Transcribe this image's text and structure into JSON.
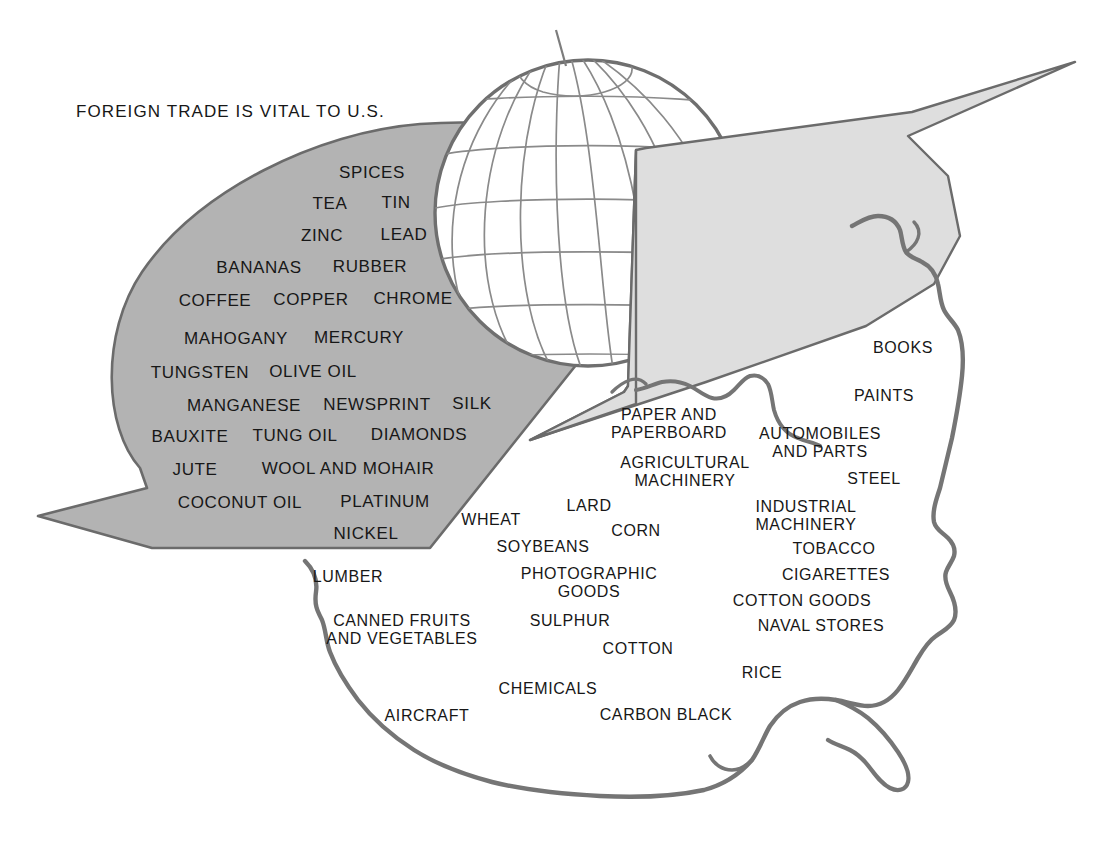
{
  "title": {
    "text": "FOREIGN TRADE IS VITAL TO U.S.",
    "x": 76,
    "y": 112
  },
  "colors": {
    "import_arrow_fill": "#b3b3b3",
    "export_arrow_fill": "#dedede",
    "outline_stroke": "#6b6b6b",
    "globe_stroke": "#6f6f6f",
    "text": "#171717",
    "background": "#ffffff"
  },
  "shapes": {
    "globe": {
      "name": "globe",
      "cx": 588,
      "cy": 213,
      "r": 153,
      "meridians": 6,
      "parallels": 7,
      "axis_tilt_deg": -6
    },
    "import_arrow": {
      "name": "imports-arrow",
      "label": "Imports arrow pointing down-left into the U.S.",
      "fill": "#b3b3b3",
      "direction": "down-left",
      "tip": [
        38,
        516
      ]
    },
    "export_arrow": {
      "name": "exports-arrow",
      "label": "Exports arrow pointing up-right out of the U.S.",
      "fill": "#dedede",
      "direction": "up-right",
      "tip": [
        1075,
        62
      ]
    },
    "us_map": {
      "name": "united-states-outline",
      "label": "Outline map of the contiguous United States"
    }
  },
  "imports": {
    "heading": "IMPORTS",
    "items": [
      {
        "text": "SPICES",
        "x": 372,
        "y": 173,
        "size": 17
      },
      {
        "text": "TEA",
        "x": 330,
        "y": 204,
        "size": 17
      },
      {
        "text": "TIN",
        "x": 396,
        "y": 203,
        "size": 17
      },
      {
        "text": "ZINC",
        "x": 322,
        "y": 236,
        "size": 17
      },
      {
        "text": "LEAD",
        "x": 404,
        "y": 235,
        "size": 17
      },
      {
        "text": "BANANAS",
        "x": 259,
        "y": 268,
        "size": 17
      },
      {
        "text": "RUBBER",
        "x": 370,
        "y": 267,
        "size": 17
      },
      {
        "text": "COFFEE",
        "x": 215,
        "y": 301,
        "size": 17
      },
      {
        "text": "COPPER",
        "x": 311,
        "y": 300,
        "size": 17
      },
      {
        "text": "CHROME",
        "x": 413,
        "y": 299,
        "size": 17
      },
      {
        "text": "MAHOGANY",
        "x": 236,
        "y": 339,
        "size": 17
      },
      {
        "text": "MERCURY",
        "x": 359,
        "y": 338,
        "size": 17
      },
      {
        "text": "TUNGSTEN",
        "x": 200,
        "y": 373,
        "size": 17
      },
      {
        "text": "OLIVE OIL",
        "x": 313,
        "y": 372,
        "size": 17
      },
      {
        "text": "MANGANESE",
        "x": 244,
        "y": 406,
        "size": 17
      },
      {
        "text": "NEWSPRINT",
        "x": 377,
        "y": 405,
        "size": 17
      },
      {
        "text": "SILK",
        "x": 472,
        "y": 404,
        "size": 17
      },
      {
        "text": "BAUXITE",
        "x": 190,
        "y": 437,
        "size": 17
      },
      {
        "text": "TUNG OIL",
        "x": 295,
        "y": 436,
        "size": 17
      },
      {
        "text": "DIAMONDS",
        "x": 419,
        "y": 435,
        "size": 17
      },
      {
        "text": "JUTE",
        "x": 195,
        "y": 470,
        "size": 17
      },
      {
        "text": "WOOL AND MOHAIR",
        "x": 348,
        "y": 469,
        "size": 17
      },
      {
        "text": "COCONUT OIL",
        "x": 240,
        "y": 503,
        "size": 17
      },
      {
        "text": "PLATINUM",
        "x": 385,
        "y": 502,
        "size": 17
      },
      {
        "text": "NICKEL",
        "x": 366,
        "y": 534,
        "size": 17
      }
    ]
  },
  "exports": {
    "heading": "EXPORTS",
    "items": [
      {
        "text": "BOOKS",
        "x": 903,
        "y": 348,
        "size": 16
      },
      {
        "text": "PAINTS",
        "x": 884,
        "y": 396,
        "size": 16
      },
      {
        "text": "PAPER AND\nPAPERBOARD",
        "x": 669,
        "y": 424,
        "size": 16
      },
      {
        "text": "AUTOMOBILES\nAND PARTS",
        "x": 820,
        "y": 443,
        "size": 16
      },
      {
        "text": "AGRICULTURAL\nMACHINERY",
        "x": 685,
        "y": 472,
        "size": 16
      },
      {
        "text": "STEEL",
        "x": 874,
        "y": 479,
        "size": 16
      },
      {
        "text": "LARD",
        "x": 589,
        "y": 506,
        "size": 16
      },
      {
        "text": "INDUSTRIAL\nMACHINERY",
        "x": 806,
        "y": 516,
        "size": 16
      },
      {
        "text": "WHEAT",
        "x": 491,
        "y": 520,
        "size": 16
      },
      {
        "text": "CORN",
        "x": 636,
        "y": 531,
        "size": 16
      },
      {
        "text": "SOYBEANS",
        "x": 543,
        "y": 547,
        "size": 16
      },
      {
        "text": "TOBACCO",
        "x": 834,
        "y": 549,
        "size": 16
      },
      {
        "text": "PHOTOGRAPHIC\nGOODS",
        "x": 589,
        "y": 583,
        "size": 16
      },
      {
        "text": "CIGARETTES",
        "x": 836,
        "y": 575,
        "size": 16
      },
      {
        "text": "LUMBER",
        "x": 348,
        "y": 577,
        "size": 16
      },
      {
        "text": "COTTON GOODS",
        "x": 802,
        "y": 601,
        "size": 16
      },
      {
        "text": "CANNED FRUITS\nAND VEGETABLES",
        "x": 402,
        "y": 630,
        "size": 16
      },
      {
        "text": "SULPHUR",
        "x": 570,
        "y": 621,
        "size": 16
      },
      {
        "text": "NAVAL STORES",
        "x": 821,
        "y": 626,
        "size": 16
      },
      {
        "text": "COTTON",
        "x": 638,
        "y": 649,
        "size": 16
      },
      {
        "text": "RICE",
        "x": 762,
        "y": 673,
        "size": 16
      },
      {
        "text": "CHEMICALS",
        "x": 548,
        "y": 689,
        "size": 16
      },
      {
        "text": "AIRCRAFT",
        "x": 427,
        "y": 716,
        "size": 16
      },
      {
        "text": "CARBON BLACK",
        "x": 666,
        "y": 715,
        "size": 16
      }
    ]
  }
}
